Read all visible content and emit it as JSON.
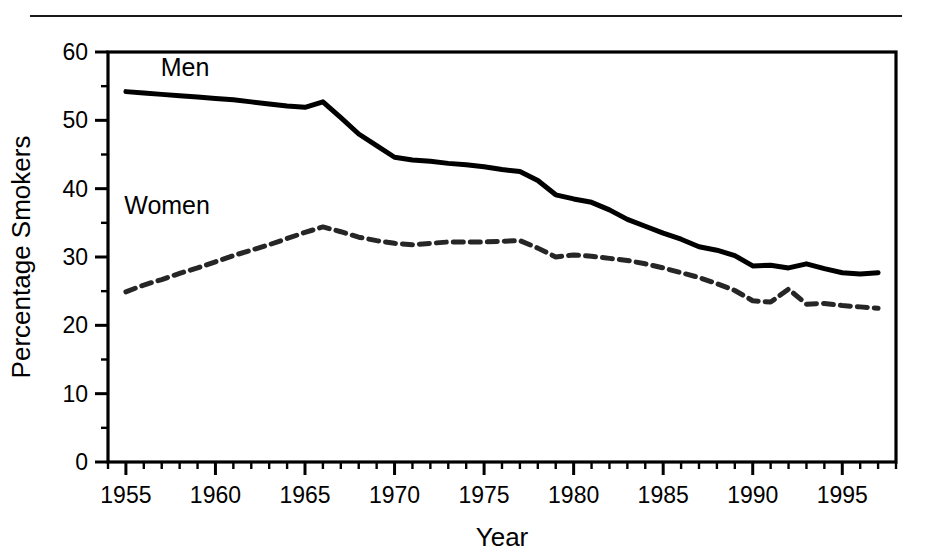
{
  "figure": {
    "top_rule": "horizontal-rule",
    "background_color": "#ffffff",
    "ink_color": "#000000"
  },
  "chart_data": {
    "type": "line",
    "title": "",
    "xlabel": "Year",
    "ylabel": "Percentage Smokers",
    "xlim": [
      1954,
      1998
    ],
    "ylim": [
      0,
      60
    ],
    "grid": false,
    "legend_position": "inline-labels",
    "x_major_ticks": [
      1955,
      1960,
      1965,
      1970,
      1975,
      1980,
      1985,
      1990,
      1995
    ],
    "x_tick_labels": [
      "1955",
      "1960",
      "1965",
      "1970",
      "1975",
      "1980",
      "1985",
      "1990",
      "1995"
    ],
    "x_minor_tick_step": 1,
    "y_major_ticks": [
      0,
      10,
      20,
      30,
      40,
      50,
      60
    ],
    "y_tick_labels": [
      "0",
      "10",
      "20",
      "30",
      "40",
      "50",
      "60"
    ],
    "y_minor_tick_step": 5,
    "x": [
      1955,
      1956,
      1957,
      1958,
      1959,
      1960,
      1961,
      1962,
      1963,
      1964,
      1965,
      1966,
      1967,
      1968,
      1969,
      1970,
      1971,
      1972,
      1973,
      1974,
      1975,
      1976,
      1977,
      1978,
      1979,
      1980,
      1981,
      1982,
      1983,
      1984,
      1985,
      1986,
      1987,
      1988,
      1989,
      1990,
      1991,
      1992,
      1993,
      1994,
      1995,
      1996,
      1997
    ],
    "series": [
      {
        "name": "Men",
        "style": "solid",
        "color": "#000000",
        "line_width": 5,
        "label_position": {
          "x": 1958.3,
          "y": 56.5
        },
        "values": [
          54.2,
          54.0,
          53.8,
          53.6,
          53.4,
          53.2,
          53.0,
          52.7,
          52.4,
          52.1,
          51.9,
          52.7,
          50.4,
          48.0,
          46.3,
          44.6,
          44.2,
          44.0,
          43.7,
          43.5,
          43.2,
          42.8,
          42.5,
          41.2,
          39.1,
          38.5,
          38.0,
          36.9,
          35.5,
          34.5,
          33.5,
          32.6,
          31.5,
          31.0,
          30.2,
          28.7,
          28.8,
          28.4,
          29.0,
          28.3,
          27.7,
          27.5,
          27.7
        ]
      },
      {
        "name": "Women",
        "style": "dashed",
        "color": "#262626",
        "line_width": 5,
        "dash_pattern": "10 7",
        "label_position": {
          "x": 1957.3,
          "y": 36.3
        },
        "values": [
          24.9,
          25.9,
          26.7,
          27.6,
          28.4,
          29.3,
          30.2,
          31.0,
          31.8,
          32.7,
          33.6,
          34.4,
          33.7,
          32.9,
          32.4,
          32.0,
          31.8,
          32.0,
          32.2,
          32.2,
          32.2,
          32.3,
          32.4,
          31.3,
          30.0,
          30.3,
          30.1,
          29.8,
          29.5,
          29.0,
          28.4,
          27.7,
          27.0,
          26.1,
          25.1,
          23.6,
          23.4,
          25.3,
          23.1,
          23.2,
          22.9,
          22.7,
          22.5
        ]
      }
    ]
  }
}
